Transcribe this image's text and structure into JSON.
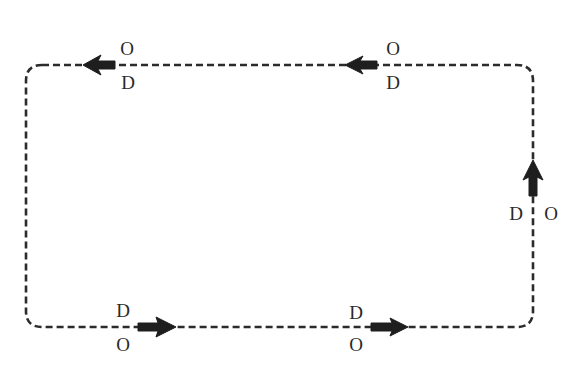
{
  "diagram": {
    "type": "circulation-loop",
    "loop": {
      "style": "dashed",
      "shape": "rounded-rectangle",
      "direction": "counterclockwise"
    },
    "colors": {
      "line": "#2b2b2b",
      "arrow": "#1e1e1e",
      "text": "#2a2a2a",
      "background": "#ffffff"
    },
    "segments": [
      {
        "id": "top-left",
        "direction": "left",
        "labels": {
          "above": "O",
          "below": "D"
        }
      },
      {
        "id": "top-right",
        "direction": "left",
        "labels": {
          "above": "O",
          "below": "D"
        }
      },
      {
        "id": "right",
        "direction": "up",
        "labels": {
          "left": "D",
          "right": "O"
        }
      },
      {
        "id": "bottom-left",
        "direction": "right",
        "labels": {
          "above": "D",
          "below": "O"
        }
      },
      {
        "id": "bottom-right",
        "direction": "right",
        "labels": {
          "above": "D",
          "below": "O"
        }
      }
    ]
  }
}
